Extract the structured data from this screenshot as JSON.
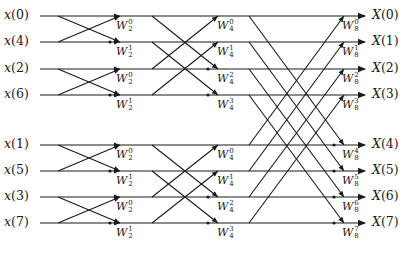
{
  "diagram": {
    "type": "8-point radix-2 DIT FFT butterfly flow graph",
    "inputs": [
      {
        "label": "x(0)",
        "name": "x",
        "index": "0",
        "y": 16
      },
      {
        "label": "x(4)",
        "name": "x",
        "index": "4",
        "y": 42
      },
      {
        "label": "x(2)",
        "name": "x",
        "index": "2",
        "y": 69
      },
      {
        "label": "x(6)",
        "name": "x",
        "index": "6",
        "y": 95
      },
      {
        "label": "x(1)",
        "name": "x",
        "index": "1",
        "y": 145
      },
      {
        "label": "x(5)",
        "name": "x",
        "index": "5",
        "y": 171
      },
      {
        "label": "x(3)",
        "name": "x",
        "index": "3",
        "y": 197
      },
      {
        "label": "x(7)",
        "name": "x",
        "index": "7",
        "y": 223
      }
    ],
    "outputs": [
      {
        "label": "X(0)",
        "name": "X",
        "index": "0"
      },
      {
        "label": "X(1)",
        "name": "X",
        "index": "1"
      },
      {
        "label": "X(2)",
        "name": "X",
        "index": "2"
      },
      {
        "label": "X(3)",
        "name": "X",
        "index": "3"
      },
      {
        "label": "X(4)",
        "name": "X",
        "index": "4"
      },
      {
        "label": "X(5)",
        "name": "X",
        "index": "5"
      },
      {
        "label": "X(6)",
        "name": "X",
        "index": "6"
      },
      {
        "label": "X(7)",
        "name": "X",
        "index": "7"
      }
    ],
    "stage1_twiddles": [
      {
        "base": "W",
        "sub": "2",
        "sup": "0"
      },
      {
        "base": "W",
        "sub": "2",
        "sup": "1"
      },
      {
        "base": "W",
        "sub": "2",
        "sup": "0"
      },
      {
        "base": "W",
        "sub": "2",
        "sup": "1"
      },
      {
        "base": "W",
        "sub": "2",
        "sup": "0"
      },
      {
        "base": "W",
        "sub": "2",
        "sup": "1"
      },
      {
        "base": "W",
        "sub": "2",
        "sup": "0"
      },
      {
        "base": "W",
        "sub": "2",
        "sup": "1"
      }
    ],
    "stage2_twiddles": [
      {
        "base": "W",
        "sub": "4",
        "sup": "0"
      },
      {
        "base": "W",
        "sub": "4",
        "sup": "1"
      },
      {
        "base": "W",
        "sub": "4",
        "sup": "2"
      },
      {
        "base": "W",
        "sub": "4",
        "sup": "3"
      },
      {
        "base": "W",
        "sub": "4",
        "sup": "0"
      },
      {
        "base": "W",
        "sub": "4",
        "sup": "1"
      },
      {
        "base": "W",
        "sub": "4",
        "sup": "2"
      },
      {
        "base": "W",
        "sub": "4",
        "sup": "3"
      }
    ],
    "stage3_twiddles": [
      {
        "base": "W",
        "sub": "8",
        "sup": "0"
      },
      {
        "base": "W",
        "sub": "8",
        "sup": "1"
      },
      {
        "base": "W",
        "sub": "8",
        "sup": "2"
      },
      {
        "base": "W",
        "sub": "8",
        "sup": "3"
      },
      {
        "base": "W",
        "sub": "8",
        "sup": "4"
      },
      {
        "base": "W",
        "sub": "8",
        "sup": "5"
      },
      {
        "base": "W",
        "sub": "8",
        "sup": "6"
      },
      {
        "base": "W",
        "sub": "8",
        "sup": "7"
      }
    ],
    "colors": {
      "line": "#1a1a1a",
      "background": "#ffffff"
    }
  }
}
